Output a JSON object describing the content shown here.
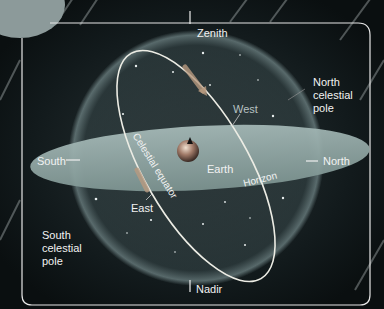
{
  "diagram": {
    "labels": {
      "zenith": "Zenith",
      "nadir": "Nadir",
      "north": "North",
      "south": "South",
      "east": "East",
      "west": "West",
      "earth": "Earth",
      "horizon": "Horizon",
      "celestial_equator": "Celestial equator",
      "north_celestial_pole": [
        "North",
        "celestial",
        "pole"
      ],
      "south_celestial_pole": [
        "South",
        "celestial",
        "pole"
      ]
    },
    "colors": {
      "background": "#0c1214",
      "sphere_glow": "#6f8a8c",
      "horizon_plane": "#8fa5a2",
      "equator_ring": "#e8e8e0",
      "arrow": "#c9a27a",
      "west_label": "#b8c2c2",
      "frame": "#e6e6e6"
    }
  }
}
